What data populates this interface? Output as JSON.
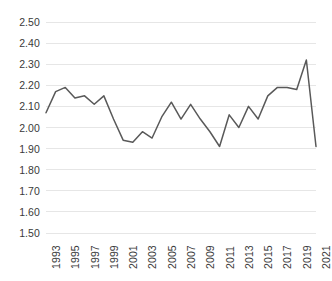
{
  "chart_data": {
    "type": "line",
    "title": "",
    "subtitle": "",
    "xlabel": "",
    "ylabel": "",
    "legend": [],
    "legend_position": "none",
    "grid": {
      "horizontal": true,
      "vertical": false,
      "color": "#e6e6e6"
    },
    "series_color": "#595959",
    "background_color": "#ffffff",
    "ylim": [
      1.5,
      2.5
    ],
    "ytick_step": 0.1,
    "ytick_labels": [
      "2.50",
      "2.40",
      "2.30",
      "2.20",
      "2.10",
      "2.00",
      "1.90",
      "1.80",
      "1.70",
      "1.60",
      "1.50"
    ],
    "ytick_values": [
      2.5,
      2.4,
      2.3,
      2.2,
      2.1,
      2.0,
      1.9,
      1.8,
      1.7,
      1.6,
      1.5
    ],
    "xtick_labels": [
      "1993",
      "1995",
      "1997",
      "1999",
      "2001",
      "2003",
      "2005",
      "2007",
      "2009",
      "2011",
      "2013",
      "2015",
      "2017",
      "2019",
      "2021"
    ],
    "xtick_values": [
      1993,
      1995,
      1997,
      1999,
      2001,
      2003,
      2005,
      2007,
      2009,
      2011,
      2013,
      2015,
      2017,
      2019,
      2021
    ],
    "xlim": [
      1993,
      2021
    ],
    "x": [
      1993,
      1994,
      1995,
      1996,
      1997,
      1998,
      1999,
      2000,
      2001,
      2002,
      2003,
      2004,
      2005,
      2006,
      2007,
      2008,
      2009,
      2010,
      2011,
      2012,
      2013,
      2014,
      2015,
      2016,
      2017,
      2018,
      2019,
      2020,
      2021
    ],
    "values": [
      2.07,
      2.17,
      2.19,
      2.14,
      2.15,
      2.11,
      2.15,
      2.04,
      1.94,
      1.93,
      1.98,
      1.95,
      2.05,
      2.12,
      2.04,
      2.11,
      2.04,
      1.98,
      1.91,
      2.06,
      2.0,
      2.1,
      2.04,
      2.15,
      2.19,
      2.19,
      2.18,
      2.32,
      1.91
    ],
    "series": [
      {
        "name": "series-1",
        "color": "#595959",
        "values": [
          2.07,
          2.17,
          2.19,
          2.14,
          2.15,
          2.11,
          2.15,
          2.04,
          1.94,
          1.93,
          1.98,
          1.95,
          2.05,
          2.12,
          2.04,
          2.11,
          2.04,
          1.98,
          1.91,
          2.06,
          2.0,
          2.1,
          2.04,
          2.15,
          2.19,
          2.19,
          2.18,
          2.32,
          1.91
        ]
      }
    ],
    "annotations": []
  },
  "plot_geometry": {
    "left": 46,
    "right": 316,
    "top": 22,
    "bottom": 233
  }
}
